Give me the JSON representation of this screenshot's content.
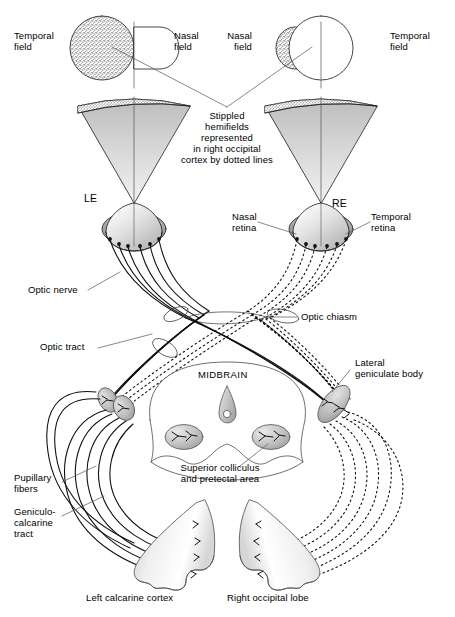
{
  "figure": {
    "type": "anatomical-diagram",
    "background_color": "#ffffff",
    "ink_color": "#000000",
    "shade_light": "#e8e8e8",
    "shade_mid": "#c9c9c9",
    "shade_dark": "#a8a8a8"
  },
  "labels": {
    "temporal_field_left": "Temporal\nfield",
    "nasal_field_left": "Nasal\nfield",
    "nasal_field_right": "Nasal\nfield",
    "temporal_field_right": "Temporal\nfield",
    "center_note": "Stippled\nhemifields\nrepresented\nin right occipital\ncortex by dotted lines",
    "left_eye": "LE",
    "right_eye": "RE",
    "nasal_retina": "Nasal\nretina",
    "temporal_retina": "Temporal\nretina",
    "optic_nerve": "Optic nerve",
    "optic_tract": "Optic tract",
    "optic_chiasm": "Optic chiasm",
    "lateral_geniculate_body": "Lateral\ngeniculate body",
    "midbrain": "MIDBRAIN",
    "superior_colliculus": "Superior colliculus\nand pretectal area",
    "pupillary_fibers": "Pupillary\nfibers",
    "geniculocalcarine_tract": "Geniculo-\ncalcarine\ntract",
    "left_calcarine_cortex": "Left calcarine cortex",
    "right_occipital_lobe": "Right occipital lobe"
  },
  "structures": [
    {
      "name": "left-visual-field",
      "parts": [
        "temporal hemifield (stippled)",
        "nasal hemifield (white)"
      ]
    },
    {
      "name": "right-visual-field",
      "parts": [
        "nasal hemifield (stippled)",
        "temporal hemifield (white)"
      ]
    },
    {
      "name": "left-projection-cone",
      "fill": "gradient-gray"
    },
    {
      "name": "right-projection-cone",
      "fill": "gradient-gray"
    },
    {
      "name": "left-eye-globe",
      "retina": "nasal + temporal"
    },
    {
      "name": "right-eye-globe",
      "retina": "nasal + temporal"
    },
    {
      "name": "optic-chiasm",
      "crossing": "nasal fibers decussate"
    },
    {
      "name": "left-lateral-geniculate-body"
    },
    {
      "name": "right-lateral-geniculate-body"
    },
    {
      "name": "superior-colliculus-left"
    },
    {
      "name": "superior-colliculus-right"
    },
    {
      "name": "cerebral-aqueduct"
    },
    {
      "name": "left-calcarine-cortex"
    },
    {
      "name": "right-occipital-lobe"
    }
  ],
  "line_styles": {
    "left_eye_fibers": "solid",
    "right_eye_fibers": "dotted"
  }
}
